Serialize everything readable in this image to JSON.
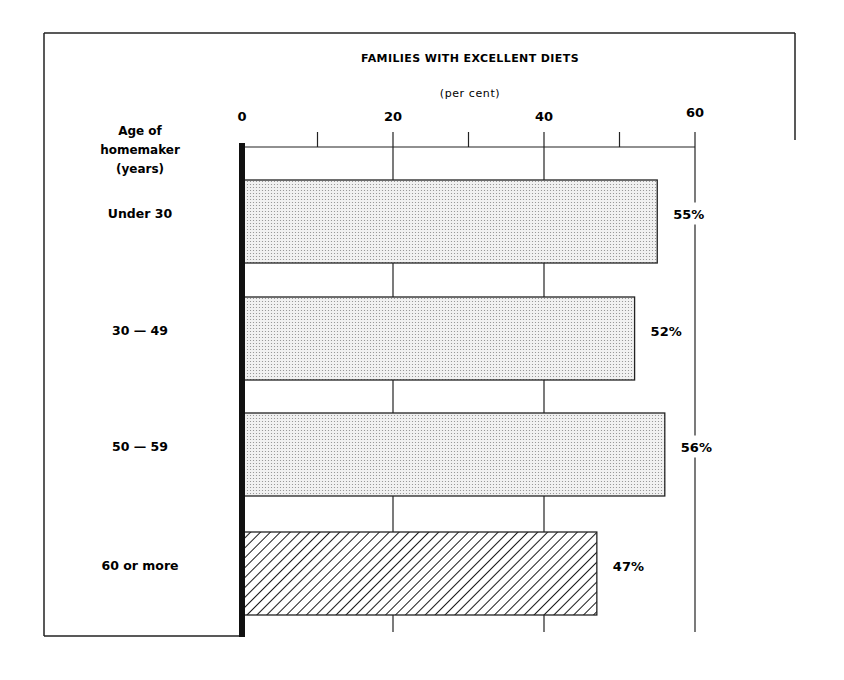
{
  "chart_data": {
    "type": "bar",
    "orientation": "horizontal",
    "title": "FAMILIES WITH EXCELLENT DIETS",
    "subtitle": "(per cent)",
    "ylabel": [
      "Age of",
      "homemaker",
      "(years)"
    ],
    "xlabel": "",
    "xlim": [
      0,
      60
    ],
    "x_ticks_major": [
      0,
      20,
      40,
      60
    ],
    "x_ticks_minor": [
      10,
      30,
      50
    ],
    "grid": true,
    "categories": [
      "Under 30",
      "30 — 49",
      "50 — 59",
      "60  or more"
    ],
    "values": [
      55,
      52,
      56,
      47
    ],
    "data_labels": [
      "55%",
      "52%",
      "56%",
      "47%"
    ],
    "fills": [
      "dotted",
      "dotted",
      "dotted",
      "hatched"
    ],
    "legend": "none"
  }
}
